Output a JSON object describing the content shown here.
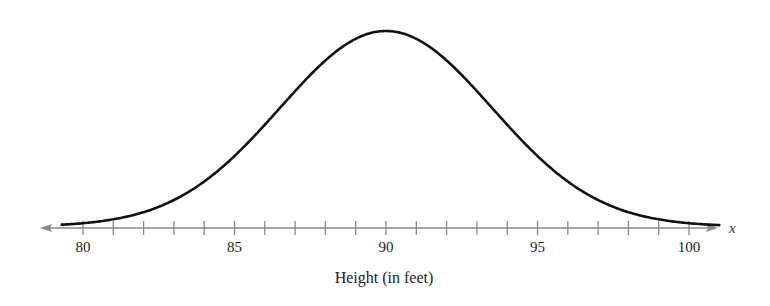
{
  "chart_data": {
    "type": "line",
    "title": "",
    "subtitle": "",
    "xlabel": "Height (in feet)",
    "ylabel": "",
    "axis_variable": "x",
    "xlim": [
      79,
      101
    ],
    "x_ticks_major": [
      80,
      85,
      90,
      95,
      100
    ],
    "x_tick_labels": [
      "80",
      "85",
      "90",
      "95",
      "100"
    ],
    "x_ticks_minor_step": 1,
    "y_axis_shown": false,
    "grid": false,
    "legend": null,
    "distribution": {
      "kind": "normal",
      "mean": 90,
      "std_dev": 3.5
    },
    "series": [
      {
        "name": "normal curve",
        "x": [
          79,
          80,
          81,
          82,
          83,
          84,
          85,
          86,
          87,
          88,
          89,
          90,
          91,
          92,
          93,
          94,
          95,
          96,
          97,
          98,
          99,
          100,
          101
        ],
        "y_relative": [
          0.007,
          0.017,
          0.037,
          0.073,
          0.135,
          0.23,
          0.36,
          0.52,
          0.693,
          0.849,
          0.96,
          1.0,
          0.96,
          0.849,
          0.693,
          0.52,
          0.36,
          0.23,
          0.135,
          0.073,
          0.037,
          0.017,
          0.007
        ]
      }
    ],
    "colors": {
      "curve": "#111111",
      "axis": "#888888",
      "text": "#222222"
    }
  }
}
